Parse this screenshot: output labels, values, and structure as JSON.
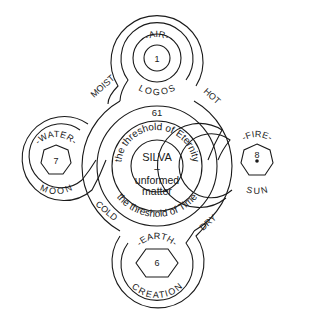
{
  "center": {
    "line1": "SILVA",
    "line2": "–",
    "line3": "unformed",
    "line4": "matter",
    "number": "61",
    "inner_ring_label": "the threshold of Eternity",
    "outer_ring_label": "the threshold of Time"
  },
  "elements": {
    "air": {
      "top": "-AIR-",
      "bottom": "LOGOS",
      "number": "1"
    },
    "water": {
      "top": "-WATER-",
      "bottom": "MOON",
      "number": "7"
    },
    "fire": {
      "top": "-FIRE-",
      "bottom": "SUN",
      "number": "8"
    },
    "earth": {
      "top": "-EARTH-",
      "bottom": "CREATION",
      "number": "6"
    }
  },
  "qualities": {
    "moist": "MOIST",
    "hot": "HOT",
    "cold": "COLD",
    "dry": "DRY"
  }
}
